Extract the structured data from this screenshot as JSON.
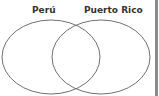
{
  "diagram": {
    "type": "venn",
    "sets": [
      {
        "label": "Perú",
        "stroke": "#707070"
      },
      {
        "label": "Puerto Rico",
        "stroke": "#707070"
      }
    ],
    "border_color": "#8a8a8a"
  }
}
